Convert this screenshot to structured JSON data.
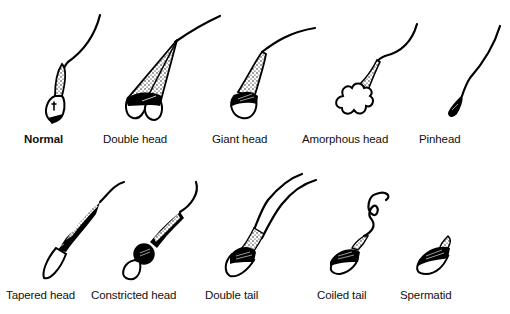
{
  "figure": {
    "rows": [
      {
        "items": [
          {
            "id": "normal",
            "label": "Normal",
            "bold": true,
            "label_x": 24,
            "label_y": 133
          },
          {
            "id": "double-head",
            "label": "Double head",
            "bold": false,
            "label_x": 103,
            "label_y": 133
          },
          {
            "id": "giant-head",
            "label": "Giant head",
            "bold": false,
            "label_x": 212,
            "label_y": 133
          },
          {
            "id": "amorphous-head",
            "label": "Amorphous head",
            "bold": false,
            "label_x": 302,
            "label_y": 133
          },
          {
            "id": "pinhead",
            "label": "Pinhead",
            "bold": false,
            "label_x": 419,
            "label_y": 133
          }
        ]
      },
      {
        "items": [
          {
            "id": "tapered-head",
            "label": "Tapered head",
            "bold": false,
            "label_x": 6,
            "label_y": 289
          },
          {
            "id": "constricted-head",
            "label": "Constricted head",
            "bold": false,
            "label_x": 91,
            "label_y": 289
          },
          {
            "id": "double-tail",
            "label": "Double tail",
            "bold": false,
            "label_x": 205,
            "label_y": 289
          },
          {
            "id": "coiled-tail",
            "label": "Coiled tail",
            "bold": false,
            "label_x": 317,
            "label_y": 289
          },
          {
            "id": "spermatid",
            "label": "Spermatid",
            "bold": false,
            "label_x": 400,
            "label_y": 289
          }
        ]
      }
    ],
    "colors": {
      "ink": "#000000",
      "background": "#ffffff"
    }
  }
}
